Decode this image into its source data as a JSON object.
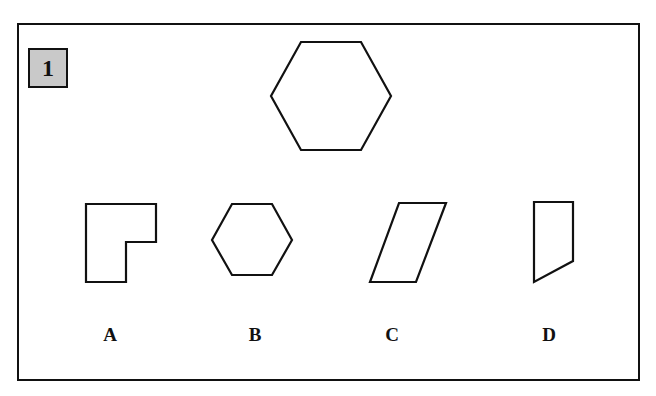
{
  "question": {
    "number": "1",
    "target_shape": "hexagon",
    "options": [
      {
        "label": "A",
        "shape": "L-shape"
      },
      {
        "label": "B",
        "shape": "hexagon"
      },
      {
        "label": "C",
        "shape": "parallelogram"
      },
      {
        "label": "D",
        "shape": "quadrilateral-slanted-bottom"
      }
    ]
  },
  "colors": {
    "stroke": "#111111",
    "badge_fill": "#c9c9c9",
    "background": "#ffffff"
  }
}
